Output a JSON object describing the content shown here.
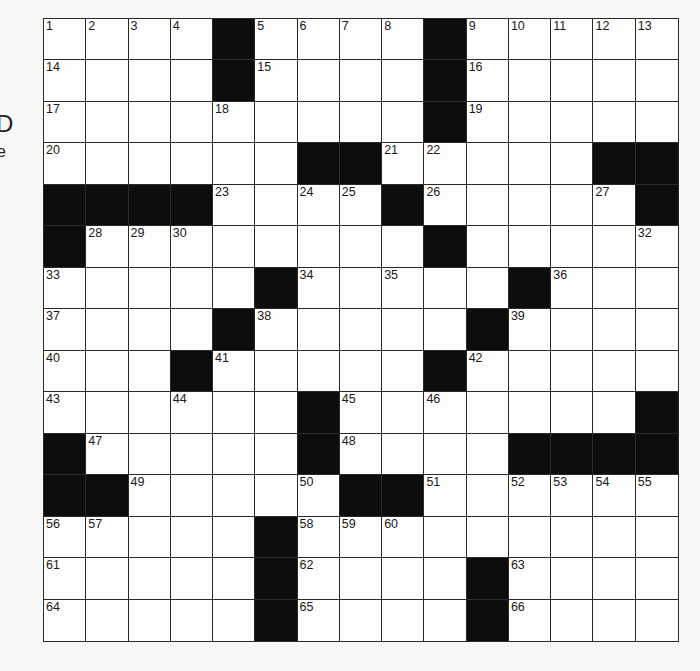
{
  "edge_text": {
    "left_top": "D",
    "left_bottom": "e"
  },
  "crossword": {
    "rows": 15,
    "cols": 15,
    "layout": [
      "....#....#.....",
      "....#....#.....",
      ".........#.....",
      "......##.....##",
      "####....#.....#",
      "#........#.....",
      ".....#.....#...",
      "....#.....#....",
      "...#.....#.....",
      "......#.......#",
      "#.....#....####",
      "##.....##......",
      ".....#.........",
      ".....#....#....",
      ".....#....#...."
    ],
    "numbers": [
      {
        "r": 0,
        "c": 0,
        "n": "1"
      },
      {
        "r": 0,
        "c": 1,
        "n": "2"
      },
      {
        "r": 0,
        "c": 2,
        "n": "3"
      },
      {
        "r": 0,
        "c": 3,
        "n": "4"
      },
      {
        "r": 0,
        "c": 5,
        "n": "5"
      },
      {
        "r": 0,
        "c": 6,
        "n": "6"
      },
      {
        "r": 0,
        "c": 7,
        "n": "7"
      },
      {
        "r": 0,
        "c": 8,
        "n": "8"
      },
      {
        "r": 0,
        "c": 10,
        "n": "9"
      },
      {
        "r": 0,
        "c": 11,
        "n": "10"
      },
      {
        "r": 0,
        "c": 12,
        "n": "11"
      },
      {
        "r": 0,
        "c": 13,
        "n": "12"
      },
      {
        "r": 0,
        "c": 14,
        "n": "13"
      },
      {
        "r": 1,
        "c": 0,
        "n": "14"
      },
      {
        "r": 1,
        "c": 5,
        "n": "15"
      },
      {
        "r": 1,
        "c": 10,
        "n": "16"
      },
      {
        "r": 2,
        "c": 0,
        "n": "17"
      },
      {
        "r": 2,
        "c": 4,
        "n": "18"
      },
      {
        "r": 2,
        "c": 10,
        "n": "19"
      },
      {
        "r": 3,
        "c": 0,
        "n": "20"
      },
      {
        "r": 3,
        "c": 8,
        "n": "21"
      },
      {
        "r": 3,
        "c": 9,
        "n": "22"
      },
      {
        "r": 4,
        "c": 4,
        "n": "23"
      },
      {
        "r": 4,
        "c": 6,
        "n": "24"
      },
      {
        "r": 4,
        "c": 7,
        "n": "25"
      },
      {
        "r": 4,
        "c": 9,
        "n": "26"
      },
      {
        "r": 4,
        "c": 13,
        "n": "27"
      },
      {
        "r": 5,
        "c": 1,
        "n": "28"
      },
      {
        "r": 5,
        "c": 2,
        "n": "29"
      },
      {
        "r": 5,
        "c": 3,
        "n": "30"
      },
      {
        "r": 5,
        "c": 9,
        "n": "31"
      },
      {
        "r": 5,
        "c": 14,
        "n": "32"
      },
      {
        "r": 6,
        "c": 0,
        "n": "33"
      },
      {
        "r": 6,
        "c": 6,
        "n": "34"
      },
      {
        "r": 6,
        "c": 8,
        "n": "35"
      },
      {
        "r": 6,
        "c": 12,
        "n": "36"
      },
      {
        "r": 7,
        "c": 0,
        "n": "37"
      },
      {
        "r": 7,
        "c": 5,
        "n": "38"
      },
      {
        "r": 7,
        "c": 11,
        "n": "39"
      },
      {
        "r": 8,
        "c": 0,
        "n": "40"
      },
      {
        "r": 8,
        "c": 4,
        "n": "41"
      },
      {
        "r": 8,
        "c": 10,
        "n": "42"
      },
      {
        "r": 9,
        "c": 0,
        "n": "43"
      },
      {
        "r": 9,
        "c": 3,
        "n": "44"
      },
      {
        "r": 9,
        "c": 7,
        "n": "45"
      },
      {
        "r": 9,
        "c": 9,
        "n": "46"
      },
      {
        "r": 10,
        "c": 1,
        "n": "47"
      },
      {
        "r": 10,
        "c": 7,
        "n": "48"
      },
      {
        "r": 11,
        "c": 2,
        "n": "49"
      },
      {
        "r": 11,
        "c": 6,
        "n": "50"
      },
      {
        "r": 11,
        "c": 9,
        "n": "51"
      },
      {
        "r": 11,
        "c": 11,
        "n": "52"
      },
      {
        "r": 11,
        "c": 12,
        "n": "53"
      },
      {
        "r": 11,
        "c": 13,
        "n": "54"
      },
      {
        "r": 11,
        "c": 14,
        "n": "55"
      },
      {
        "r": 12,
        "c": 0,
        "n": "56"
      },
      {
        "r": 12,
        "c": 1,
        "n": "57"
      },
      {
        "r": 12,
        "c": 6,
        "n": "58"
      },
      {
        "r": 12,
        "c": 7,
        "n": "59"
      },
      {
        "r": 12,
        "c": 8,
        "n": "60"
      },
      {
        "r": 13,
        "c": 0,
        "n": "61"
      },
      {
        "r": 13,
        "c": 6,
        "n": "62"
      },
      {
        "r": 13,
        "c": 11,
        "n": "63"
      },
      {
        "r": 14,
        "c": 0,
        "n": "64"
      },
      {
        "r": 14,
        "c": 6,
        "n": "65"
      },
      {
        "r": 14,
        "c": 11,
        "n": "66"
      }
    ],
    "colors": {
      "black_square": "#0d0d0d",
      "white_square": "#fdfdfc",
      "grid_line": "#2a2a2a"
    }
  }
}
